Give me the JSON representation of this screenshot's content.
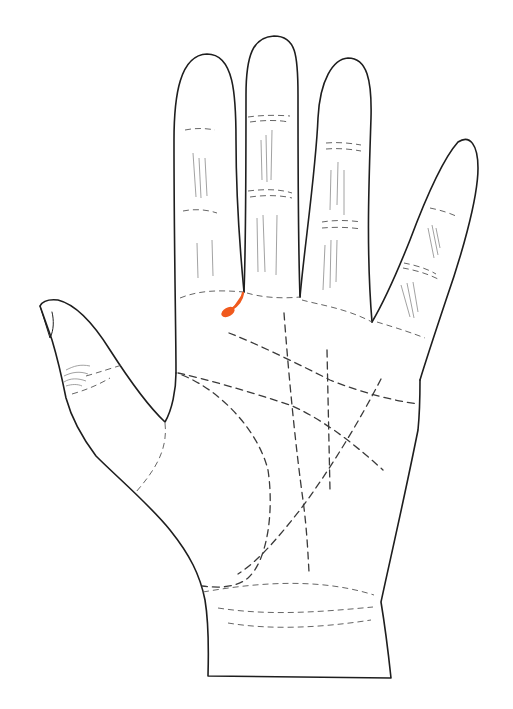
{
  "diagram": {
    "type": "palmistry-hand",
    "view": "right palm, fingers up",
    "background": "#ffffff",
    "outline_color": "#1e1e1e",
    "line_color": "#3a3a3a",
    "highlight_color": "#f05a1e",
    "parts": {
      "thumb": "thumb",
      "index": "index finger",
      "middle": "middle finger",
      "ring": "ring finger",
      "pinky": "little finger",
      "palm": "palm",
      "wrist": "wrist"
    },
    "lines": {
      "heart": "heart line",
      "head": "head line",
      "life": "life line",
      "fate": "fate line",
      "sun": "sun line",
      "mercury": "mercury line",
      "bracelets": "wrist bracelet lines"
    },
    "highlight": {
      "label": "highlighted mark between index and middle finger",
      "shape": "teardrop stroke"
    }
  }
}
